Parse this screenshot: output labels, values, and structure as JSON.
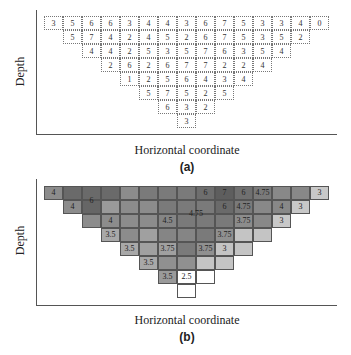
{
  "panel_a": {
    "caption": "(a)",
    "xlabel": "Horizontal coordinate",
    "ylabel": "Depth"
  },
  "panel_b": {
    "caption": "(b)",
    "xlabel": "Horizontal coordinate",
    "ylabel": "Depth"
  },
  "chart_data": [
    {
      "type": "heatmap",
      "title": "(a)",
      "xlabel": "Horizontal coordinate",
      "ylabel": "Depth",
      "grid": "inverted triangle, 15 columns x 8 rows, dotted cell borders",
      "rows": [
        {
          "start_col": 0,
          "values": [
            3,
            5,
            6,
            6,
            3,
            4,
            4,
            3,
            6,
            7,
            5,
            3,
            3,
            4,
            0
          ]
        },
        {
          "start_col": 1,
          "values": [
            5,
            7,
            4,
            2,
            4,
            5,
            2,
            6,
            7,
            5,
            3,
            5,
            2
          ]
        },
        {
          "start_col": 2,
          "values": [
            4,
            4,
            2,
            5,
            3,
            5,
            7,
            6,
            3,
            5,
            4
          ]
        },
        {
          "start_col": 3,
          "values": [
            2,
            6,
            2,
            6,
            7,
            7,
            2,
            2,
            4
          ]
        },
        {
          "start_col": 4,
          "values": [
            1,
            2,
            5,
            6,
            4,
            3,
            4
          ]
        },
        {
          "start_col": 5,
          "values": [
            5,
            7,
            5,
            2,
            5
          ]
        },
        {
          "start_col": 6,
          "values": [
            6,
            3,
            2
          ]
        },
        {
          "start_col": 7,
          "values": [
            3
          ]
        }
      ]
    },
    {
      "type": "heatmap",
      "title": "(b)",
      "xlabel": "Horizontal coordinate",
      "ylabel": "Depth",
      "grid": "inverted triangle, 15 columns x 8 rows, grayscale shaded regions",
      "shades": [
        {
          "start_col": 0,
          "colors": [
            "#8c8c8c",
            "#6a6a6a",
            "#6a6a6a",
            "#6a6a6a",
            "#8c8c8c",
            "#7a7a7a",
            "#7a7a7a",
            "#7a7a7a",
            "#6e6e6e",
            "#5e5e5e",
            "#707070",
            "#7a7a7a",
            "#888888",
            "#888888",
            "#c8c8c8"
          ]
        },
        {
          "start_col": 1,
          "colors": [
            "#8c8c8c",
            "#666666",
            "#9a9a9a",
            "#8c8c8c",
            "#8c8c8c",
            "#7a7a7a",
            "#7a7a7a",
            "#7a7a7a",
            "#6a6a6a",
            "#7a7a7a",
            "#888888",
            "#888888",
            "#c8c8c8"
          ]
        },
        {
          "start_col": 2,
          "colors": [
            "#8c8c8c",
            "#8c8c8c",
            "#8c8c8c",
            "#8c8c8c",
            "#858585",
            "#7a7a7a",
            "#7a7a7a",
            "#7a7a7a",
            "#8c8c8c",
            "#888888",
            "#c8c8c8"
          ]
        },
        {
          "start_col": 3,
          "colors": [
            "#a8a8a8",
            "#8c8c8c",
            "#a0a0a0",
            "#858585",
            "#858585",
            "#7a7a7a",
            "#909090",
            "#c4c4c4",
            "#c4c4c4"
          ]
        },
        {
          "start_col": 4,
          "colors": [
            "#a8a8a8",
            "#a0a0a0",
            "#a0a0a0",
            "#7a7a7a",
            "#909090",
            "#c4c4c4",
            "#c4c4c4"
          ]
        },
        {
          "start_col": 5,
          "colors": [
            "#a8a8a8",
            "#909090",
            "#909090",
            "#c4c4c4",
            "#c4c4c4"
          ]
        },
        {
          "start_col": 6,
          "colors": [
            "#9a9a9a",
            "#ffffff",
            "#ffffff"
          ]
        },
        {
          "start_col": 7,
          "colors": [
            "#ffffff"
          ]
        }
      ],
      "region_labels": [
        {
          "text": "4",
          "row": 0,
          "col": 0
        },
        {
          "text": "6",
          "row": 0.6,
          "col": 2
        },
        {
          "text": "4",
          "row": 1,
          "col": 1
        },
        {
          "text": "4",
          "row": 2,
          "col": 3
        },
        {
          "text": "3.5",
          "row": 3,
          "col": 3
        },
        {
          "text": "3.5",
          "row": 4,
          "col": 4
        },
        {
          "text": "4.5",
          "row": 2,
          "col": 6
        },
        {
          "text": "3.75",
          "row": 4,
          "col": 6
        },
        {
          "text": "3.5",
          "row": 5,
          "col": 5
        },
        {
          "text": "3.5",
          "row": 6,
          "col": 6
        },
        {
          "text": "2.5",
          "row": 6,
          "col": 7
        },
        {
          "text": "4.75",
          "row": 1.5,
          "col": 7.5
        },
        {
          "text": "6",
          "row": 0,
          "col": 8
        },
        {
          "text": "7",
          "row": 0,
          "col": 9
        },
        {
          "text": "6",
          "row": 0,
          "col": 10
        },
        {
          "text": "4.75",
          "row": 0,
          "col": 11
        },
        {
          "text": "3",
          "row": 0,
          "col": 14
        },
        {
          "text": "6",
          "row": 1,
          "col": 9
        },
        {
          "text": "4.75",
          "row": 1,
          "col": 10
        },
        {
          "text": "4",
          "row": 1,
          "col": 12
        },
        {
          "text": "3",
          "row": 1,
          "col": 13
        },
        {
          "text": "3.75",
          "row": 2,
          "col": 10
        },
        {
          "text": "3",
          "row": 2,
          "col": 12
        },
        {
          "text": "3.75",
          "row": 3,
          "col": 9
        },
        {
          "text": "3.75",
          "row": 4,
          "col": 8
        },
        {
          "text": "3",
          "row": 4,
          "col": 9
        }
      ]
    }
  ]
}
